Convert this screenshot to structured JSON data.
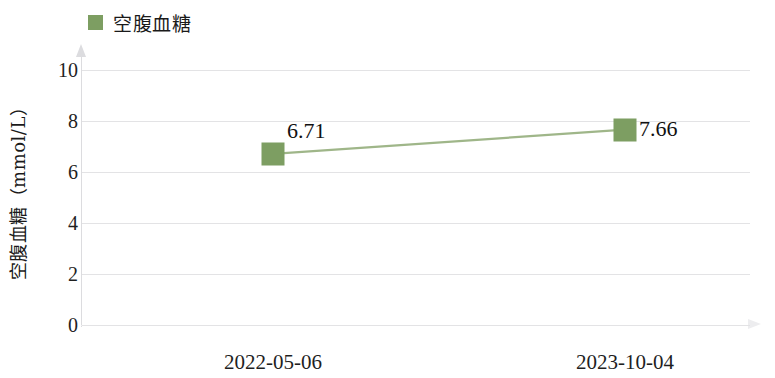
{
  "legend": {
    "label": "空腹血糖",
    "swatch_color": "#7d9e62",
    "position": "top-left"
  },
  "axes": {
    "y_title": "空腹血糖（mmol/L）",
    "y_ticks": [
      "0",
      "2",
      "4",
      "6",
      "8",
      "10"
    ],
    "x_title": ""
  },
  "chart_data": {
    "type": "line",
    "title": "",
    "subtitle": "",
    "xlabel": "",
    "ylabel": "空腹血糖（mmol/L）",
    "categories": [
      "2022-05-06",
      "2023-10-04"
    ],
    "series": [
      {
        "name": "空腹血糖",
        "values": [
          6.71,
          7.66
        ],
        "color": "#7d9e62",
        "marker": "square",
        "labels": [
          "6.71",
          "7.66"
        ]
      }
    ],
    "ylim": [
      0,
      10
    ],
    "ytick_step": 2,
    "yticks": [
      0,
      2,
      4,
      6,
      8,
      10
    ],
    "grid": true,
    "grid_axis": "y",
    "legend_position": "top-left",
    "axis_arrows": true
  }
}
